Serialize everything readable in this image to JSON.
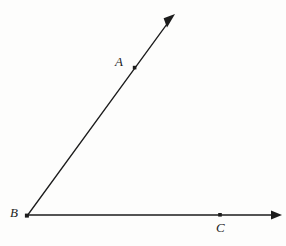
{
  "figure": {
    "kind": "geometry-diagram",
    "background_color": "#fdfdfc",
    "ink_color": "#1c1c1c",
    "width": 286,
    "height": 246,
    "points": [
      {
        "id": "A",
        "label": "A",
        "x": 135,
        "y": 68,
        "marker": "dot"
      },
      {
        "id": "B",
        "label": "B",
        "x": 27,
        "y": 216,
        "marker": "dot"
      },
      {
        "id": "C",
        "label": "C",
        "x": 220,
        "y": 215,
        "marker": "dot"
      }
    ],
    "rays": [
      {
        "id": "ray-BA",
        "name": "ray-ba",
        "from": "B",
        "through": "A",
        "start": {
          "x": 27,
          "y": 216
        },
        "end": {
          "x": 175,
          "y": 14
        },
        "arrowhead_at": "end",
        "stroke_width": 1.3
      },
      {
        "id": "ray-BC",
        "name": "ray-bc",
        "from": "B",
        "through": "C",
        "start": {
          "x": 27,
          "y": 215
        },
        "end": {
          "x": 282,
          "y": 215
        },
        "arrowhead_at": "end",
        "stroke_width": 1.3
      }
    ],
    "labels": {
      "a": "A",
      "b": "B",
      "c": "C"
    }
  }
}
